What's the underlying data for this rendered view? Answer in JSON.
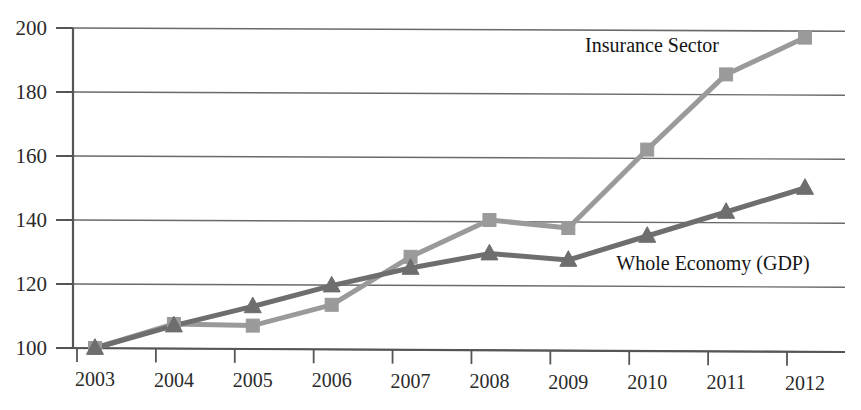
{
  "chart_data": {
    "type": "line",
    "title": "",
    "subtitle": "",
    "xlabel": "",
    "ylabel": "",
    "categories": [
      "2003",
      "2004",
      "2005",
      "2006",
      "2007",
      "2008",
      "2009",
      "2010",
      "2011",
      "2012"
    ],
    "x": [
      2003,
      2004,
      2005,
      2006,
      2007,
      2008,
      2009,
      2010,
      2011,
      2012
    ],
    "xlim": [
      2003,
      2012
    ],
    "ylim": [
      100,
      200
    ],
    "y_ticks": [
      100,
      120,
      140,
      160,
      180,
      200
    ],
    "y_tick_labels": [
      "100",
      "120",
      "140",
      "160",
      "180",
      "200"
    ],
    "x_tick_labels": [
      "2003",
      "2004",
      "2005",
      "2006",
      "2007",
      "2008",
      "2009",
      "2010",
      "2011",
      "2012"
    ],
    "grid": true,
    "grid_axis": "y",
    "legend": "inline-annotations",
    "legend_position": "inside-plot",
    "series": [
      {
        "name": "Insurance Sector",
        "marker": "square",
        "color": "#9a9a9a",
        "values": [
          100,
          107.5,
          107,
          113.5,
          128.5,
          140,
          137.5,
          162,
          185.5,
          197
        ]
      },
      {
        "name": "Whole Economy (GDP)",
        "marker": "triangle",
        "color": "#6e6e6e",
        "values": [
          100,
          107,
          113,
          119.5,
          125,
          129.5,
          127.5,
          135,
          142.5,
          150
        ]
      }
    ],
    "annotations": [
      {
        "text": "Insurance Sector",
        "series": "Insurance Sector",
        "x_px": 652,
        "y_px": 52
      },
      {
        "text": "Whole Economy (GDP)",
        "series": "Whole Economy (GDP)",
        "x_px": 713,
        "y_px": 270
      }
    ]
  },
  "colors": {
    "insurance": "#9a9a9a",
    "gdp": "#6e6e6e",
    "axis": "#555555",
    "grid": "#6a6a6a",
    "text": "#2a2a2a",
    "background": "#ffffff"
  }
}
